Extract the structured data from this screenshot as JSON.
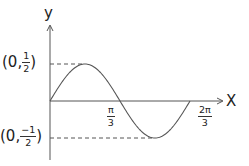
{
  "chart_data": {
    "type": "line",
    "title": "",
    "function": "y = (1/2) sin(3x)",
    "xlabel": "X",
    "ylabel": "y",
    "x_ticks": [
      {
        "value": 1.0472,
        "label_num": "π",
        "label_den": "3"
      },
      {
        "value": 2.0944,
        "label_num": "2π",
        "label_den": "3"
      }
    ],
    "y_ticks": [
      {
        "value": 0.5,
        "label_prefix": "(0,",
        "label_num": "1",
        "label_den": "2",
        "label_suffix": ")"
      },
      {
        "value": -0.5,
        "label_prefix": "(0,",
        "label_num": "−1",
        "label_den": "2",
        "label_suffix": ")"
      }
    ],
    "xlim": [
      0,
      2.0944
    ],
    "ylim": [
      -0.5,
      0.5
    ],
    "series": [
      {
        "name": "curve",
        "x": [
          0,
          0.1745,
          0.3491,
          0.5236,
          0.6981,
          0.8727,
          1.0472,
          1.2217,
          1.3963,
          1.5708,
          1.7453,
          1.9199,
          2.0944
        ],
        "y": [
          0,
          0.25,
          0.433,
          0.5,
          0.433,
          0.25,
          0,
          -0.25,
          -0.433,
          -0.5,
          -0.433,
          -0.25,
          0
        ]
      }
    ],
    "annotations": [
      "dashed line from (0, 1/2) to maximum",
      "dashed line from (0, -1/2) to minimum"
    ],
    "grid": false,
    "legend": null,
    "colors": {
      "curve": "#555555",
      "axis": "#555555",
      "dashes": "#555555"
    }
  },
  "labels": {
    "y_axis": "y",
    "x_axis": "X",
    "ymax": {
      "prefix": "(0,",
      "num": "1",
      "den": "2",
      "suffix": ")"
    },
    "ymin": {
      "prefix": "(0,",
      "num": "−1",
      "den": "2",
      "suffix": ")"
    },
    "xtick1": {
      "num": "π",
      "den": "3"
    },
    "xtick2": {
      "num": "2π",
      "den": "3"
    }
  }
}
